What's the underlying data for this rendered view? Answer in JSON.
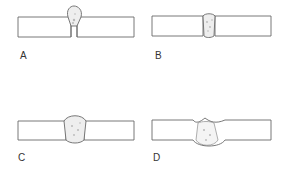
{
  "figure": {
    "panels": [
      {
        "id": "A",
        "label": "A",
        "description": "Weld bead above plate surface with narrow root gap"
      },
      {
        "id": "B",
        "label": "B",
        "description": "Full penetration weld nearly flush with plate"
      },
      {
        "id": "C",
        "label": "C",
        "description": "Weld with slight reinforcement top and bottom"
      },
      {
        "id": "D",
        "label": "D",
        "description": "Weld with undercut at top and root protrusion below"
      }
    ],
    "colors": {
      "line": "#6a6a6a",
      "weld_fill": "#eeeeee",
      "stipple": "#b8b8b8"
    }
  }
}
